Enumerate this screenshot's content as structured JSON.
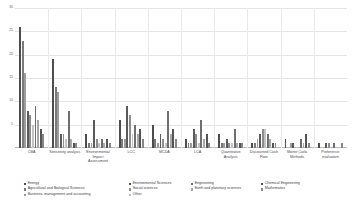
{
  "chart_data": {
    "type": "bar",
    "title": "",
    "subtitle": "",
    "xlabel": "",
    "ylabel": "",
    "ylim": [
      0,
      30
    ],
    "grid": true,
    "legend_position": "bottom",
    "y_ticks": [
      "30",
      "25",
      "20",
      "15",
      "10",
      "5"
    ],
    "y_tick_values": [
      30,
      25,
      20,
      15,
      10,
      5
    ],
    "categories": [
      "CBA",
      "Sensitivity analysis",
      "Environmental Impact Assessment",
      "LCC",
      "MCDA",
      "LCA",
      "Quantitative Analysis",
      "Discounted Cash Flow",
      "Monte Carlo Methods",
      "Preference evaluation"
    ],
    "series": [
      {
        "name": "Energy",
        "color": "#4d4d4d",
        "values": [
          26,
          19,
          3,
          6,
          5,
          2,
          3,
          1,
          2,
          1
        ]
      },
      {
        "name": "Agricultural and Biological Sciences",
        "color": "#7a7a7a",
        "values": [
          23,
          13,
          1,
          2,
          2,
          1,
          1,
          1,
          0,
          0
        ]
      },
      {
        "name": "Business, management and accounting",
        "color": "#9c9c9c",
        "values": [
          16,
          12,
          1,
          2,
          1,
          1,
          1,
          2,
          1,
          0
        ]
      },
      {
        "name": "Environmental Sciences",
        "color": "#5a5a5a",
        "values": [
          8,
          3,
          6,
          9,
          3,
          4,
          2,
          3,
          1,
          1
        ]
      },
      {
        "name": "Social sciences",
        "color": "#8d8d8d",
        "values": [
          7,
          3,
          2,
          7,
          2,
          3,
          1,
          4,
          0,
          1
        ]
      },
      {
        "name": "Other",
        "color": "#c2c2c2",
        "values": [
          5,
          2,
          1,
          3,
          1,
          1,
          1,
          4,
          0,
          0
        ]
      },
      {
        "name": "Engineering",
        "color": "#6e6e6e",
        "values": [
          9,
          8,
          2,
          5,
          8,
          6,
          4,
          3,
          2,
          1
        ]
      },
      {
        "name": "Earth and planetary sciences",
        "color": "#a8a8a8",
        "values": [
          6,
          2,
          1,
          3,
          3,
          2,
          1,
          2,
          1,
          0
        ]
      },
      {
        "name": "Chemical Engineering",
        "color": "#545454",
        "values": [
          4,
          1,
          2,
          4,
          4,
          3,
          1,
          1,
          3,
          0
        ]
      },
      {
        "name": "Mathematics",
        "color": "#878787",
        "values": [
          3,
          1,
          1,
          2,
          2,
          1,
          1,
          1,
          1,
          1
        ]
      }
    ]
  },
  "legend": {
    "items": [
      {
        "label": "Energy",
        "color": "#4d4d4d"
      },
      {
        "label": "Environmental Sciences",
        "color": "#5a5a5a"
      },
      {
        "label": "Engineering",
        "color": "#6e6e6e"
      },
      {
        "label": "Chemical Engineering",
        "color": "#545454"
      },
      {
        "label": "Agricultural and Biological Sciences",
        "color": "#7a7a7a"
      },
      {
        "label": "Social sciences",
        "color": "#8d8d8d"
      },
      {
        "label": "Earth and planetary sciences",
        "color": "#a8a8a8"
      },
      {
        "label": "Mathematics",
        "color": "#878787"
      },
      {
        "label": "Business, management and accounting",
        "color": "#9c9c9c"
      },
      {
        "label": "Other",
        "color": "#c2c2c2"
      }
    ]
  },
  "colors": {
    "gridline": "#e4e4e4",
    "axis": "#b9b9b9",
    "tick_text": "#6a6a6a",
    "label_text": "#4a4a4a",
    "background": "#ffffff"
  }
}
